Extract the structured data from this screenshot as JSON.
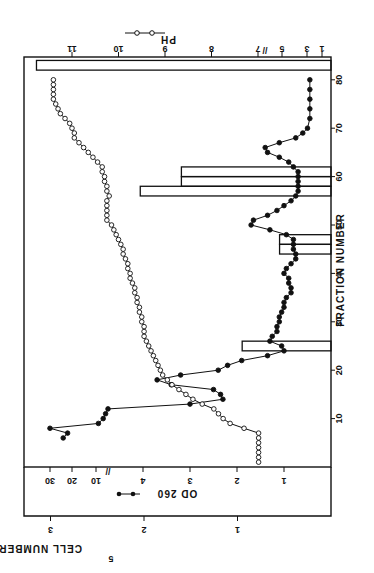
{
  "chart_data": {
    "type": "line",
    "orientation_note": "figure rotated 90 degrees clockwise on page",
    "xlabel": "FRACTION NUMBER",
    "x_ticks": [
      10,
      20,
      30,
      40,
      50,
      60,
      70,
      80
    ],
    "x_range": [
      0,
      85
    ],
    "left_axes": [
      {
        "name": "OD 260",
        "ticks_low": [
          1,
          2,
          3,
          4
        ],
        "ticks_high": [
          10,
          20,
          30
        ],
        "axis_break": true,
        "legend_marker": "filled-circle"
      },
      {
        "name": "CELL NUMBER X 10^5",
        "ticks": [
          1,
          2,
          3
        ],
        "range": [
          0,
          3.3
        ]
      }
    ],
    "right_axis": {
      "name": "PH",
      "ticks": [
        7,
        8,
        9,
        10,
        11
      ],
      "ticks_below_break": [
        1,
        3,
        5
      ],
      "axis_break": true,
      "legend_marker": "open-circle"
    },
    "series": [
      {
        "name": "OD 260",
        "marker": "filled-circle",
        "points": [
          [
            6,
            24
          ],
          [
            7,
            22
          ],
          [
            8,
            30
          ],
          [
            9,
            9
          ],
          [
            10,
            7
          ],
          [
            11,
            6
          ],
          [
            12,
            5
          ],
          [
            13,
            3.0
          ],
          [
            14,
            2.3
          ],
          [
            15,
            2.35
          ],
          [
            16,
            2.5
          ],
          [
            17,
            3.4
          ],
          [
            18,
            3.7
          ],
          [
            19,
            3.2
          ],
          [
            20,
            2.4
          ],
          [
            21,
            2.2
          ],
          [
            22,
            1.9
          ],
          [
            23,
            1.35
          ],
          [
            24,
            1.0
          ],
          [
            25,
            1.05
          ],
          [
            26,
            1.3
          ],
          [
            27,
            1.25
          ],
          [
            28,
            1.15
          ],
          [
            29,
            1.15
          ],
          [
            30,
            1.1
          ],
          [
            31,
            1.1
          ],
          [
            32,
            1.05
          ],
          [
            33,
            1.0
          ],
          [
            34,
            1.0
          ],
          [
            35,
            0.95
          ],
          [
            36,
            0.85
          ],
          [
            37,
            0.85
          ],
          [
            38,
            0.9
          ],
          [
            39,
            0.9
          ],
          [
            40,
            1.0
          ],
          [
            41,
            0.95
          ],
          [
            42,
            0.85
          ],
          [
            43,
            0.75
          ],
          [
            44,
            0.75
          ],
          [
            45,
            0.8
          ],
          [
            46,
            0.8
          ],
          [
            47,
            0.8
          ],
          [
            48,
            0.95
          ],
          [
            49,
            1.3
          ],
          [
            50,
            1.7
          ],
          [
            51,
            1.65
          ],
          [
            52,
            1.35
          ],
          [
            53,
            1.15
          ],
          [
            54,
            1.0
          ],
          [
            55,
            0.85
          ],
          [
            56,
            0.75
          ],
          [
            57,
            0.7
          ],
          [
            58,
            0.7
          ],
          [
            59,
            0.7
          ],
          [
            60,
            0.7
          ],
          [
            61,
            0.7
          ],
          [
            62,
            0.8
          ],
          [
            63,
            0.9
          ],
          [
            64,
            1.1
          ],
          [
            65,
            1.35
          ],
          [
            66,
            1.4
          ],
          [
            67,
            1.1
          ],
          [
            68,
            0.75
          ],
          [
            69,
            0.6
          ],
          [
            70,
            0.5
          ],
          [
            72,
            0.45
          ],
          [
            74,
            0.45
          ],
          [
            76,
            0.45
          ],
          [
            78,
            0.45
          ],
          [
            80,
            0.45
          ]
        ]
      },
      {
        "name": "PH",
        "marker": "open-circle",
        "points": [
          [
            1,
            6.95
          ],
          [
            2,
            6.95
          ],
          [
            3,
            6.95
          ],
          [
            4,
            6.95
          ],
          [
            5,
            6.95
          ],
          [
            6,
            6.95
          ],
          [
            7,
            6.95
          ],
          [
            8,
            7.3
          ],
          [
            9,
            7.6
          ],
          [
            10,
            7.75
          ],
          [
            11,
            7.85
          ],
          [
            12,
            7.95
          ],
          [
            13,
            8.2
          ],
          [
            14,
            8.4
          ],
          [
            15,
            8.55
          ],
          [
            16,
            8.7
          ],
          [
            17,
            8.85
          ],
          [
            18,
            8.95
          ],
          [
            19,
            9.05
          ],
          [
            20,
            9.1
          ],
          [
            21,
            9.15
          ],
          [
            22,
            9.2
          ],
          [
            23,
            9.25
          ],
          [
            24,
            9.3
          ],
          [
            25,
            9.35
          ],
          [
            26,
            9.4
          ],
          [
            27,
            9.45
          ],
          [
            28,
            9.45
          ],
          [
            29,
            9.45
          ],
          [
            30,
            9.5
          ],
          [
            31,
            9.5
          ],
          [
            32,
            9.55
          ],
          [
            33,
            9.55
          ],
          [
            34,
            9.6
          ],
          [
            35,
            9.6
          ],
          [
            36,
            9.65
          ],
          [
            37,
            9.65
          ],
          [
            38,
            9.7
          ],
          [
            39,
            9.75
          ],
          [
            40,
            9.75
          ],
          [
            41,
            9.8
          ],
          [
            42,
            9.8
          ],
          [
            43,
            9.85
          ],
          [
            44,
            9.9
          ],
          [
            45,
            9.9
          ],
          [
            46,
            9.95
          ],
          [
            47,
            10.0
          ],
          [
            48,
            10.05
          ],
          [
            49,
            10.1
          ],
          [
            50,
            10.15
          ],
          [
            51,
            10.25
          ],
          [
            52,
            10.25
          ],
          [
            53,
            10.25
          ],
          [
            54,
            10.25
          ],
          [
            55,
            10.25
          ],
          [
            56,
            10.2
          ],
          [
            57,
            10.25
          ],
          [
            58,
            10.25
          ],
          [
            59,
            10.3
          ],
          [
            60,
            10.3
          ],
          [
            61,
            10.35
          ],
          [
            62,
            10.35
          ],
          [
            63,
            10.45
          ],
          [
            64,
            10.55
          ],
          [
            65,
            10.65
          ],
          [
            66,
            10.75
          ],
          [
            67,
            10.85
          ],
          [
            68,
            10.95
          ],
          [
            69,
            10.95
          ],
          [
            70,
            11.0
          ],
          [
            71,
            11.05
          ],
          [
            72,
            11.15
          ],
          [
            73,
            11.25
          ],
          [
            74,
            11.3
          ],
          [
            75,
            11.35
          ],
          [
            76,
            11.4
          ],
          [
            77,
            11.4
          ],
          [
            78,
            11.4
          ],
          [
            79,
            11.4
          ],
          [
            80,
            11.4
          ]
        ]
      }
    ],
    "bars": {
      "name": "CELL NUMBER X 10^5",
      "items": [
        {
          "from": 24,
          "to": 26,
          "value": 0.95
        },
        {
          "from": 44,
          "to": 46,
          "value": 0.55
        },
        {
          "from": 46,
          "to": 48,
          "value": 0.55
        },
        {
          "from": 56,
          "to": 58,
          "value": 2.04
        },
        {
          "from": 58,
          "to": 60,
          "value": 1.6
        },
        {
          "from": 60,
          "to": 62,
          "value": 1.6
        },
        {
          "from": 82,
          "to": 84,
          "value": 3.15
        }
      ]
    }
  },
  "labels": {
    "x_axis": "FRACTION NUMBER",
    "cell_axis": "CELL NUMBER  X  10",
    "cell_axis_exp": "5",
    "od_legend": "OD 260",
    "ph_legend": "PH",
    "break_mark": "//"
  }
}
